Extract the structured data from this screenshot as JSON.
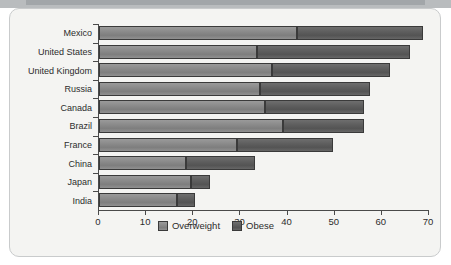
{
  "chart_data": {
    "type": "bar",
    "orientation": "horizontal",
    "stacked": true,
    "title": "",
    "subtitle": "",
    "xlabel": "",
    "ylabel": "",
    "xlim": [
      0,
      70
    ],
    "xticks": [
      0,
      10,
      20,
      30,
      40,
      50,
      60,
      70
    ],
    "xtick_labels": [
      "0",
      "10",
      "20",
      "30",
      "40",
      "50",
      "60",
      "70"
    ],
    "grid": false,
    "legend_position": "bottom-center",
    "legend": [
      "Overweight",
      "Obese"
    ],
    "categories": [
      "Mexico",
      "United States",
      "United Kingdom",
      "Russia",
      "Canada",
      "Brazil",
      "France",
      "China",
      "Japan",
      "India"
    ],
    "series": [
      {
        "name": "Overweight",
        "color": "#8a8a8a",
        "values": [
          42.0,
          33.6,
          36.8,
          34.2,
          35.3,
          39.1,
          29.3,
          18.4,
          19.5,
          16.5
        ]
      },
      {
        "name": "Obese",
        "color": "#5e5e5e",
        "values": [
          26.7,
          32.3,
          25.0,
          23.2,
          21.0,
          17.1,
          20.3,
          14.7,
          4.1,
          3.9
        ]
      }
    ],
    "totals": [
      68.7,
      65.9,
      61.8,
      57.4,
      56.3,
      56.2,
      49.6,
      33.1,
      23.6,
      20.4
    ]
  },
  "legend": {
    "items": [
      {
        "label": "Overweight",
        "color": "#8a8a8a"
      },
      {
        "label": "Obese",
        "color": "#5e5e5e"
      }
    ]
  },
  "colors": {
    "panel_background": "#f4f4f2",
    "panel_border": "#c9cbcc",
    "top_strip": "#b9bcbe",
    "axis": "#4a4a4a",
    "text": "#2c2c2c",
    "overweight": "#8a8a8a",
    "obese": "#5e5e5e"
  }
}
